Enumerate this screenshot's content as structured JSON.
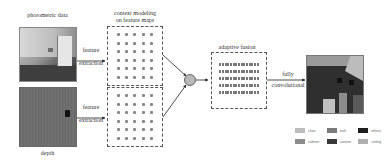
{
  "diagram": {
    "inputs": {
      "rgb_label": "photometric data",
      "depth_label": "depth"
    },
    "edges": {
      "top_extraction": [
        "feature",
        "extraction"
      ],
      "bottom_extraction": [
        "feature",
        "extraction"
      ],
      "fully_conv": [
        "fully",
        "convolutional"
      ]
    },
    "context_box": {
      "title": [
        "context modeling",
        "on feature maps"
      ],
      "columns": 5,
      "rows_per_column": 6
    },
    "fusion_box": {
      "title": "adaptive fusion",
      "rows": 5
    },
    "legend": [
      {
        "label": "chair",
        "color": "#bdbdbd"
      },
      {
        "label": "wall",
        "color": "#7a7a7a"
      },
      {
        "label": "others",
        "color": "#1e1e1e"
      },
      {
        "label": "cabinet",
        "color": "#8c8c8c"
      },
      {
        "label": "counter",
        "color": "#3a3a3a"
      },
      {
        "label": "ceiling",
        "color": "#b0b0b0"
      }
    ]
  }
}
